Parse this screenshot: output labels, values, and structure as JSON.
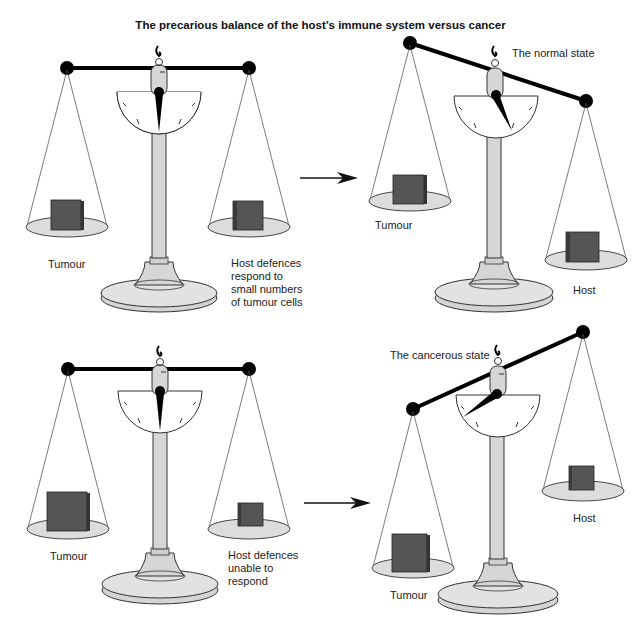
{
  "title": "The precarious balance of the host’s immune system versus cancer",
  "colors": {
    "beam": "#000000",
    "pan": "#dcdcdc",
    "stand": "#d9d9d9",
    "block": "#555555",
    "block_side": "#3a3a3a",
    "line": "#333333"
  },
  "panels": [
    {
      "id": "top-left",
      "left_label": "Tumour",
      "right_label": "Host defences\nrespond to\nsmall numbers\nof tumour cells",
      "state_label": ""
    },
    {
      "id": "top-right",
      "left_label": "Tumour",
      "right_label": "Host",
      "state_label": "The normal state"
    },
    {
      "id": "bottom-left",
      "left_label": "Tumour",
      "right_label": "Host defences\nunable to\nrespond",
      "state_label": ""
    },
    {
      "id": "bottom-right",
      "left_label": "Tumour",
      "right_label": "Host",
      "state_label": "The cancerous state"
    }
  ],
  "arrows": [
    {
      "id": "arrow-top",
      "icon": "right-arrow-icon"
    },
    {
      "id": "arrow-bottom",
      "icon": "right-arrow-icon"
    }
  ]
}
